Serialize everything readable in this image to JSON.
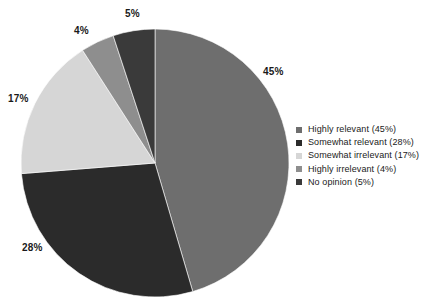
{
  "chart_data": {
    "type": "pie",
    "title": "",
    "categories": [
      "Highly relevant",
      "Somewhat relevant",
      "Somewhat irrelevant",
      "Highly irrelevant",
      "No opinion"
    ],
    "values": [
      45,
      28,
      17,
      4,
      5
    ],
    "unit": "%",
    "data_labels": [
      "45%",
      "28%",
      "17%",
      "4%",
      "5%"
    ],
    "colors": [
      "#6e6e6e",
      "#2b2b2b",
      "#d6d6d6",
      "#8e8e8e",
      "#3a3a3a"
    ],
    "start_angle_deg": 0,
    "direction": "clockwise",
    "grid": false,
    "legend_position": "right",
    "legend_entries": [
      "Highly relevant (45%)",
      "Somewhat relevant (28%)",
      "Somewhat irrelevant (17%)",
      "Highly irrelevant (4%)",
      "No opinion (5%)"
    ]
  },
  "labels": {
    "highly_relevant": "45%",
    "somewhat_relevant": "28%",
    "somewhat_irrelevant": "17%",
    "highly_irrelevant": "4%",
    "no_opinion": "5%"
  },
  "legend": {
    "items": [
      {
        "label": "Highly relevant (45%)",
        "color": "#6e6e6e",
        "icon": "square-swatch-icon"
      },
      {
        "label": "Somewhat relevant (28%)",
        "color": "#2b2b2b",
        "icon": "square-swatch-icon"
      },
      {
        "label": "Somewhat irrelevant (17%)",
        "color": "#d6d6d6",
        "icon": "square-swatch-icon"
      },
      {
        "label": "Highly irrelevant (4%)",
        "color": "#8e8e8e",
        "icon": "square-swatch-icon"
      },
      {
        "label": "No opinion (5%)",
        "color": "#3a3a3a",
        "icon": "square-swatch-icon"
      }
    ]
  }
}
